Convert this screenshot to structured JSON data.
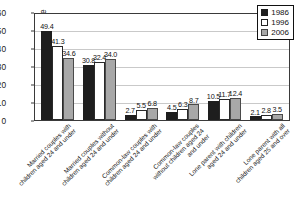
{
  "chart_data": {
    "type": "bar",
    "title": "",
    "xlabel": "",
    "ylabel": "Percentage",
    "ylim": [
      0,
      60
    ],
    "yticks": [
      0,
      10,
      20,
      30,
      40,
      50,
      60
    ],
    "grid": true,
    "legend_position": "top-right",
    "categories": [
      "Married couples with children aged 24 and under",
      "Married couples without children aged 24 and under",
      "Common-law couples with children aged 24 and under",
      "Common-law couples without children aged 24 and under",
      "Lone parent with children aged 24 and under",
      "Lone parent with all children aged 25 and over"
    ],
    "series": [
      {
        "name": "1986",
        "color": "#1e1e1e",
        "values": [
          49.4,
          30.8,
          2.7,
          4.5,
          10.5,
          2.1
        ]
      },
      {
        "name": "1996",
        "color": "#ffffff",
        "values": [
          41.3,
          32.4,
          5.5,
          6.3,
          11.7,
          2.8
        ]
      },
      {
        "name": "2006",
        "color": "#a8a8a8",
        "values": [
          34.6,
          34.0,
          6.8,
          8.7,
          12.4,
          3.5
        ]
      }
    ],
    "value_labels": [
      [
        "49.4",
        "41.3",
        "34.6"
      ],
      [
        "30.8",
        "32.4",
        "34.0"
      ],
      [
        "2.7",
        "5.5",
        "6.8"
      ],
      [
        "4.5",
        "6.3",
        "8.7"
      ],
      [
        "10.5",
        "11.7",
        "12.4"
      ],
      [
        "2.1",
        "2.8",
        "3.5"
      ]
    ]
  }
}
